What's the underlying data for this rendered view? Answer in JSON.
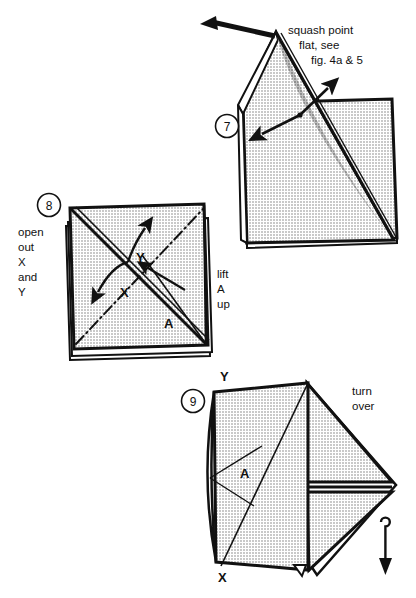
{
  "document": {
    "kind": "origami-instruction-diagram",
    "background_color": "#ffffff",
    "ink_color": "#111111",
    "paper_fill_color": "#d6d6d6"
  },
  "figures": [
    {
      "id": "figure-7",
      "step_number": "7",
      "captions": [
        {
          "name": "squash-caption",
          "lines": [
            "squash point",
            "flat, see",
            "fig. 4a & 5"
          ]
        }
      ],
      "point_labels": [],
      "arrows": [
        {
          "name": "apex-push-arrow",
          "type": "solid-straight",
          "direction": "left"
        },
        {
          "name": "squash-open-arrow-upper",
          "type": "solid-straight",
          "direction": "up-right"
        },
        {
          "name": "squash-open-arrow-lower",
          "type": "solid-straight",
          "direction": "down-left"
        }
      ]
    },
    {
      "id": "figure-8",
      "step_number": "8",
      "captions": [
        {
          "name": "open-out-caption",
          "lines": [
            "open",
            "out",
            "X",
            "and",
            "Y"
          ]
        },
        {
          "name": "lift-a-up-caption",
          "lines": [
            "lift",
            "A",
            "up"
          ]
        }
      ],
      "point_labels": [
        "X",
        "Y",
        "A"
      ],
      "arrows": [
        {
          "name": "x-open-arrow",
          "type": "curved",
          "direction": "down-left"
        },
        {
          "name": "y-open-arrow",
          "type": "curved",
          "direction": "up-right"
        },
        {
          "name": "lift-a-arrow",
          "type": "solid-straight",
          "direction": "up-left"
        }
      ]
    },
    {
      "id": "figure-9",
      "step_number": "9",
      "captions": [
        {
          "name": "turn-over-caption",
          "lines": [
            "turn",
            "over"
          ]
        }
      ],
      "point_labels": [
        "Y",
        "X",
        "A"
      ],
      "arrows": [
        {
          "name": "turn-over-arrow",
          "type": "loop-down",
          "direction": "down"
        }
      ]
    }
  ],
  "text": {
    "fig7_line1": "squash point",
    "fig7_line2": "flat, see",
    "fig7_line3": "fig. 4a & 5",
    "fig8_open1": "open",
    "fig8_open2": "out",
    "fig8_open3": "X",
    "fig8_open4": "and",
    "fig8_open5": "Y",
    "fig8_lift1": "lift",
    "fig8_lift2": "A",
    "fig8_lift3": "up",
    "fig8_label_x": "X",
    "fig8_label_y": "Y",
    "fig8_label_a": "A",
    "fig9_turn1": "turn",
    "fig9_turn2": "over",
    "fig9_label_y": "Y",
    "fig9_label_x": "X",
    "fig9_label_a": "A",
    "step7": "7",
    "step8": "8",
    "step9": "9"
  }
}
